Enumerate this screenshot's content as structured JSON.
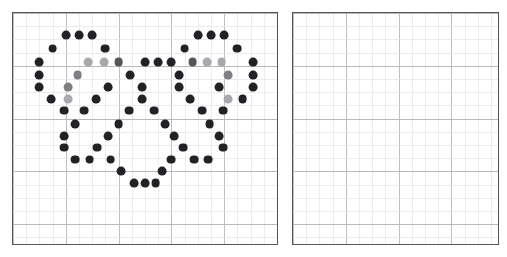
{
  "figure": {
    "type": "dot-grid-pattern",
    "background_color": "#ffffff"
  },
  "grid": {
    "cell_size_px": 13.2,
    "minor_line_color": "#e6e6e8",
    "major_line_color": "#b9b9bd",
    "major_every": 4,
    "border_color": "#545454",
    "border_width_px": 1.6
  },
  "panels": [
    {
      "id": "left-panel",
      "name": "heart-pattern-panel",
      "x": 12,
      "y": 12,
      "width": 266,
      "height": 233,
      "cols": 20,
      "rows": 17,
      "empty": false,
      "dot_count": 94
    },
    {
      "id": "right-panel",
      "name": "empty-grid-panel",
      "x": 292,
      "y": 12,
      "width": 207,
      "height": 233,
      "cols": 16,
      "rows": 17,
      "empty": true,
      "dot_count": 0
    }
  ],
  "palette": {
    "dark": "#222226",
    "mid": "#555559",
    "gray": "#7f7f83",
    "light": "#a9a9ad"
  },
  "dot_style": {
    "radius_px": 4.4,
    "shape": "circle"
  },
  "chart_data": {
    "type": "scatter",
    "title": "",
    "xlabel": "",
    "ylabel": "",
    "grid": true,
    "legend": false,
    "xlim": [
      0,
      20
    ],
    "ylim": [
      0,
      17
    ],
    "note": "Left panel scatter of heart outline; right panel has no data points",
    "series": [
      {
        "name": "heart-dots",
        "points": [
          {
            "x": 4.0,
            "y": 1.7,
            "c": "dark"
          },
          {
            "x": 5.0,
            "y": 1.7,
            "c": "dark"
          },
          {
            "x": 6.0,
            "y": 1.7,
            "c": "dark"
          },
          {
            "x": 14.0,
            "y": 1.7,
            "c": "dark"
          },
          {
            "x": 15.0,
            "y": 1.7,
            "c": "dark"
          },
          {
            "x": 16.0,
            "y": 1.7,
            "c": "dark"
          },
          {
            "x": 3.0,
            "y": 2.7,
            "c": "dark"
          },
          {
            "x": 7.0,
            "y": 2.7,
            "c": "dark"
          },
          {
            "x": 13.0,
            "y": 2.7,
            "c": "dark"
          },
          {
            "x": 17.0,
            "y": 2.7,
            "c": "dark"
          },
          {
            "x": 2.0,
            "y": 3.7,
            "c": "dark"
          },
          {
            "x": 5.7,
            "y": 3.7,
            "c": "light"
          },
          {
            "x": 6.9,
            "y": 3.7,
            "c": "light"
          },
          {
            "x": 8.0,
            "y": 3.7,
            "c": "mid"
          },
          {
            "x": 10.0,
            "y": 3.7,
            "c": "dark"
          },
          {
            "x": 11.0,
            "y": 3.7,
            "c": "dark"
          },
          {
            "x": 12.0,
            "y": 3.7,
            "c": "dark"
          },
          {
            "x": 13.6,
            "y": 3.7,
            "c": "mid"
          },
          {
            "x": 14.7,
            "y": 3.7,
            "c": "light"
          },
          {
            "x": 15.8,
            "y": 3.7,
            "c": "light"
          },
          {
            "x": 18.2,
            "y": 3.7,
            "c": "dark"
          },
          {
            "x": 2.0,
            "y": 4.7,
            "c": "dark"
          },
          {
            "x": 4.9,
            "y": 4.7,
            "c": "gray"
          },
          {
            "x": 8.9,
            "y": 4.7,
            "c": "dark"
          },
          {
            "x": 12.6,
            "y": 4.7,
            "c": "dark"
          },
          {
            "x": 16.3,
            "y": 4.7,
            "c": "gray"
          },
          {
            "x": 18.2,
            "y": 4.7,
            "c": "dark"
          },
          {
            "x": 2.0,
            "y": 5.6,
            "c": "dark"
          },
          {
            "x": 4.2,
            "y": 5.6,
            "c": "gray"
          },
          {
            "x": 7.2,
            "y": 5.6,
            "c": "dark"
          },
          {
            "x": 9.8,
            "y": 5.6,
            "c": "dark"
          },
          {
            "x": 12.6,
            "y": 5.6,
            "c": "dark"
          },
          {
            "x": 15.6,
            "y": 5.6,
            "c": "dark"
          },
          {
            "x": 18.2,
            "y": 5.6,
            "c": "dark"
          },
          {
            "x": 2.9,
            "y": 6.5,
            "c": "dark"
          },
          {
            "x": 4.2,
            "y": 6.5,
            "c": "light"
          },
          {
            "x": 6.3,
            "y": 6.5,
            "c": "dark"
          },
          {
            "x": 9.8,
            "y": 6.5,
            "c": "dark"
          },
          {
            "x": 13.4,
            "y": 6.5,
            "c": "dark"
          },
          {
            "x": 16.3,
            "y": 6.5,
            "c": "light"
          },
          {
            "x": 17.4,
            "y": 6.5,
            "c": "dark"
          },
          {
            "x": 3.9,
            "y": 7.4,
            "c": "dark"
          },
          {
            "x": 5.4,
            "y": 7.4,
            "c": "dark"
          },
          {
            "x": 8.8,
            "y": 7.4,
            "c": "dark"
          },
          {
            "x": 10.7,
            "y": 7.4,
            "c": "dark"
          },
          {
            "x": 14.3,
            "y": 7.4,
            "c": "dark"
          },
          {
            "x": 15.9,
            "y": 7.4,
            "c": "dark"
          },
          {
            "x": 4.7,
            "y": 8.4,
            "c": "dark"
          },
          {
            "x": 8.0,
            "y": 8.4,
            "c": "dark"
          },
          {
            "x": 11.5,
            "y": 8.4,
            "c": "dark"
          },
          {
            "x": 14.9,
            "y": 8.4,
            "c": "dark"
          },
          {
            "x": 3.9,
            "y": 9.3,
            "c": "dark"
          },
          {
            "x": 7.2,
            "y": 9.3,
            "c": "dark"
          },
          {
            "x": 12.2,
            "y": 9.3,
            "c": "dark"
          },
          {
            "x": 15.6,
            "y": 9.3,
            "c": "dark"
          },
          {
            "x": 3.9,
            "y": 10.2,
            "c": "dark"
          },
          {
            "x": 6.4,
            "y": 10.2,
            "c": "dark"
          },
          {
            "x": 12.9,
            "y": 10.2,
            "c": "dark"
          },
          {
            "x": 15.9,
            "y": 10.2,
            "c": "dark"
          },
          {
            "x": 4.7,
            "y": 11.1,
            "c": "dark"
          },
          {
            "x": 5.8,
            "y": 11.1,
            "c": "dark"
          },
          {
            "x": 7.4,
            "y": 11.1,
            "c": "dark"
          },
          {
            "x": 12.0,
            "y": 11.1,
            "c": "dark"
          },
          {
            "x": 13.7,
            "y": 11.1,
            "c": "dark"
          },
          {
            "x": 14.8,
            "y": 11.1,
            "c": "dark"
          },
          {
            "x": 8.2,
            "y": 12.0,
            "c": "dark"
          },
          {
            "x": 11.3,
            "y": 12.0,
            "c": "dark"
          },
          {
            "x": 9.2,
            "y": 12.9,
            "c": "dark"
          },
          {
            "x": 10.0,
            "y": 12.9,
            "c": "dark"
          },
          {
            "x": 10.8,
            "y": 12.9,
            "c": "dark"
          }
        ]
      }
    ]
  }
}
